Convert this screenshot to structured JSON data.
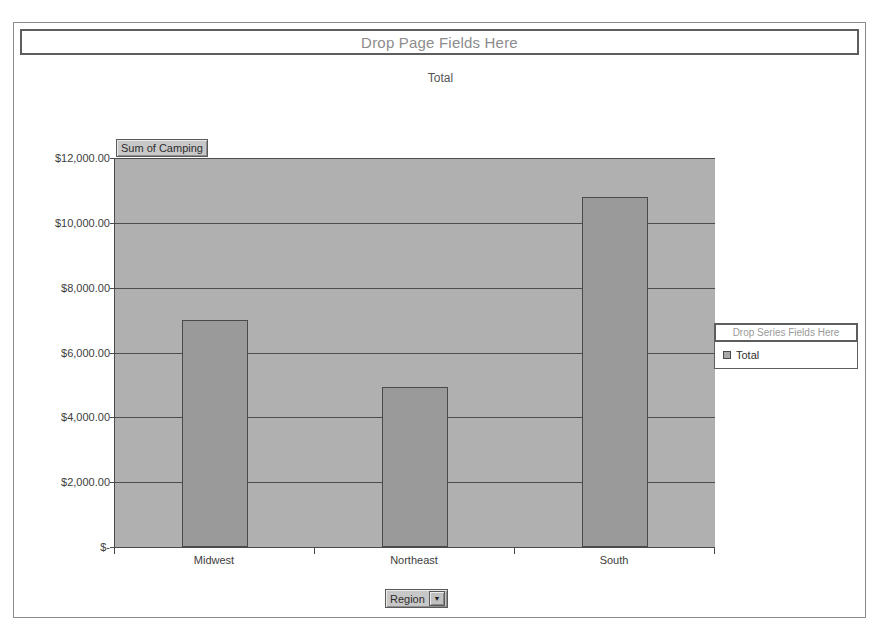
{
  "pivot_chart": {
    "page_field_drop_label": "Drop Page Fields Here",
    "chart_title": "Total",
    "value_field_label": "Sum of Camping",
    "row_field_label": "Region",
    "row_field_dropdown_icon": "chevron-down-icon",
    "series_field_drop_label": "Drop Series Fields Here"
  },
  "legend": {
    "title": "Drop Series Fields Here",
    "entries": [
      {
        "label": "Total",
        "color": "#a8a8a8"
      }
    ]
  },
  "chart_data": {
    "type": "bar",
    "title": "Total",
    "categories": [
      "Midwest",
      "Northeast",
      "South"
    ],
    "series": [
      {
        "name": "Total",
        "values": [
          7000,
          4950,
          10800
        ]
      }
    ],
    "values": [
      7000,
      4950,
      10800
    ],
    "xlabel": "Region",
    "ylabel": "Sum of Camping",
    "ylim": [
      0,
      12000
    ],
    "ytick_values": [
      0,
      2000,
      4000,
      6000,
      8000,
      10000,
      12000
    ],
    "ytick_labels": [
      "$-",
      "$2,000.00",
      "$4,000.00",
      "$6,000.00",
      "$8,000.00",
      "$10,000.00",
      "$12,000.00"
    ],
    "grid": true,
    "legend_position": "right",
    "plot_background": "#b0b0b0",
    "bar_color": "#9a9a9a"
  }
}
